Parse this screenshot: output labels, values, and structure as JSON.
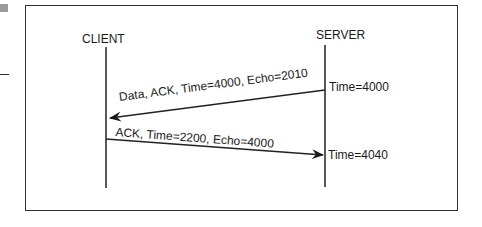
{
  "diagram": {
    "type": "sequence",
    "participants": [
      {
        "id": "client",
        "label": "CLIENT"
      },
      {
        "id": "server",
        "label": "SERVER"
      }
    ],
    "messages": [
      {
        "from": "server",
        "to": "client",
        "label": "Data, ACK, Time=4000, Echo=2010",
        "server_time": "Time=4000"
      },
      {
        "from": "client",
        "to": "server",
        "label": "ACK, Time=2200, Echo=4000",
        "server_time": "Time=4040"
      }
    ]
  }
}
